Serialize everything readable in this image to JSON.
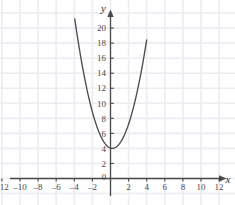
{
  "figure": {
    "background_color": "#ffffff",
    "grid_color": "#ececf2",
    "axis_color": "#4a4a4a",
    "curve_color": "#4d4d4d",
    "label_color": "#4a4a4a",
    "axis_name_color": "#2e2e2e"
  },
  "axes": {
    "x_axis_name": "x",
    "y_axis_name": "y",
    "origin_label": "0"
  },
  "chart_data": {
    "type": "line",
    "title": "",
    "subtitle": "",
    "xlabel": "x",
    "ylabel": "y",
    "xlim": [
      -13.5,
      13.5
    ],
    "ylim": [
      -1.5,
      21.5
    ],
    "xticks": [
      -12,
      -10,
      -8,
      -6,
      -4,
      -2,
      0,
      2,
      4,
      6,
      8,
      10,
      12
    ],
    "yticks": [
      2,
      4,
      6,
      8,
      10,
      12,
      14,
      16,
      18,
      20
    ],
    "xtick_labels": [
      "-12",
      "-10",
      "-8",
      "-6",
      "-4",
      "-2",
      "0",
      "2",
      "4",
      "6",
      "8",
      "10",
      "12"
    ],
    "ytick_labels": [
      "2",
      "4",
      "6",
      "8",
      "10",
      "12",
      "14",
      "16",
      "18",
      "20"
    ],
    "grid": true,
    "grid_step": 2,
    "legend": "none",
    "annotations": [],
    "series": [
      {
        "name": "y = x^2 + 4",
        "equation": "y = x^2 + 4",
        "vertex": [
          0.2,
          4
        ],
        "x_domain": [
          -4.0,
          4.0
        ],
        "x": [
          -4.0,
          -3.75,
          -3.5,
          -3.25,
          -3.0,
          -2.75,
          -2.5,
          -2.25,
          -2.0,
          -1.75,
          -1.5,
          -1.25,
          -1.0,
          -0.75,
          -0.5,
          -0.25,
          0.0,
          0.2,
          0.25,
          0.5,
          0.75,
          1.0,
          1.25,
          1.5,
          1.75,
          2.0,
          2.25,
          2.5,
          2.75,
          3.0,
          3.25,
          3.5,
          3.75,
          4.0
        ],
        "y": [
          21.64,
          19.6,
          17.69,
          11.9,
          14.24,
          12.7,
          11.29,
          10.0,
          8.84,
          7.8,
          6.89,
          6.1,
          5.44,
          4.9,
          4.49,
          4.2,
          4.04,
          4.0,
          4.0,
          4.09,
          4.3,
          4.64,
          5.1,
          5.69,
          6.4,
          7.24,
          8.2,
          9.29,
          10.5,
          11.84,
          13.3,
          14.89,
          16.6,
          18.44
        ]
      }
    ]
  }
}
